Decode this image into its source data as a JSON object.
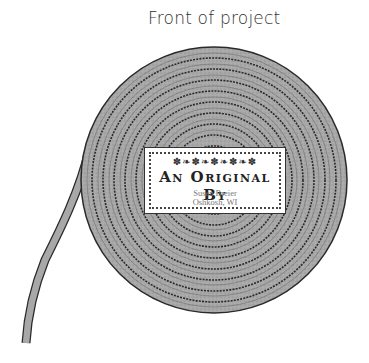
{
  "title": "Front of project",
  "label": {
    "ornament": "✽❧✽❧✽❧✽❧✽",
    "heading": "An Original By",
    "name": "Susan Breier",
    "location": "Oshkosh, WI"
  },
  "colors": {
    "coil_fill": "#a8a8a8",
    "coil_line": "#2a2a2a",
    "label_bg": "#ffffff"
  },
  "coil": {
    "center": [
      214,
      180
    ],
    "radius": 133,
    "rings": 10
  }
}
